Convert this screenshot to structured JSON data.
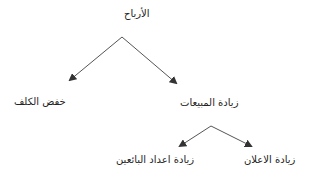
{
  "diagram": {
    "type": "tree",
    "nodes": {
      "root": {
        "label": "الأرباح"
      },
      "cost": {
        "label": "خفض الكلف"
      },
      "sales": {
        "label": "زيادة المبيعات"
      },
      "sellers": {
        "label": "زيادة اعداد البائعين"
      },
      "ads": {
        "label": "زيادة الاعلان"
      }
    },
    "edges": [
      {
        "from": "root",
        "to": "cost"
      },
      {
        "from": "root",
        "to": "sales"
      },
      {
        "from": "sales",
        "to": "sellers"
      },
      {
        "from": "sales",
        "to": "ads"
      }
    ],
    "colors": {
      "line": "#555555",
      "text": "#222222",
      "background": "#ffffff"
    }
  }
}
